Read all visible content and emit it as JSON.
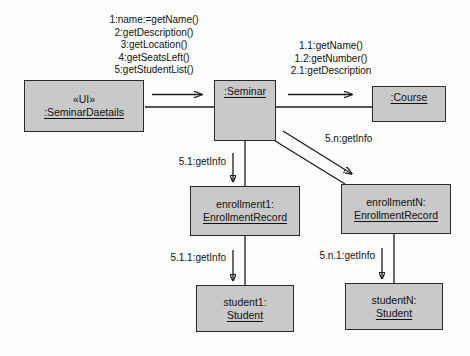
{
  "diagram": {
    "type": "uml-collaboration-diagram"
  },
  "objects": [
    {
      "id": "seminar-details",
      "stereotype": "«UI»",
      "instance_name": ":SeminarDaetails"
    },
    {
      "id": "seminar",
      "stereotype": "",
      "instance_name": ":Seminar"
    },
    {
      "id": "course",
      "stereotype": "",
      "instance_name": ":Course"
    },
    {
      "id": "enrollment1",
      "stereotype": "enrollment1:",
      "instance_name": "EnrollmentRecord"
    },
    {
      "id": "enrollmentN",
      "stereotype": "enrollmentN:",
      "instance_name": "EnrollmentRecord"
    },
    {
      "id": "student1",
      "stereotype": "student1:",
      "instance_name": "Student"
    },
    {
      "id": "studentN",
      "stereotype": "studentN:",
      "instance_name": "Student"
    }
  ],
  "messages": {
    "ui_to_seminar": [
      "1:name:=getName()",
      "2:getDescription()",
      "3:getLocation()",
      "4:getSeatsLeft()",
      "5:getStudentList()"
    ],
    "seminar_to_course": [
      "1.1:getName()",
      "1.2:getNumber()",
      "2.1:getDescription"
    ],
    "seminar_to_enrollment1": "5.1:getInfo",
    "seminar_to_enrollmentN": "5.n:getInfo",
    "enrollment1_to_student1": "5.1.1:getInfo",
    "enrollmentN_to_studentN": "5.n.1:getInfo"
  },
  "colors": {
    "box_fill": "#c9c9c9",
    "box_border": "#2a2a2a",
    "line": "#1c1c1c",
    "text": "#111111",
    "background": "#fdfdfd"
  }
}
